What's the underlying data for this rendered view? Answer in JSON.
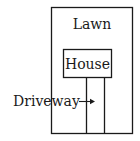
{
  "diagram": {
    "labels": {
      "lawn": "Lawn",
      "house": "House",
      "driveway": "Driveway"
    },
    "colors": {
      "stroke": "#1a1a1a",
      "background": "#ffffff"
    },
    "icons": {
      "pointer": "arrow-right-icon"
    }
  }
}
